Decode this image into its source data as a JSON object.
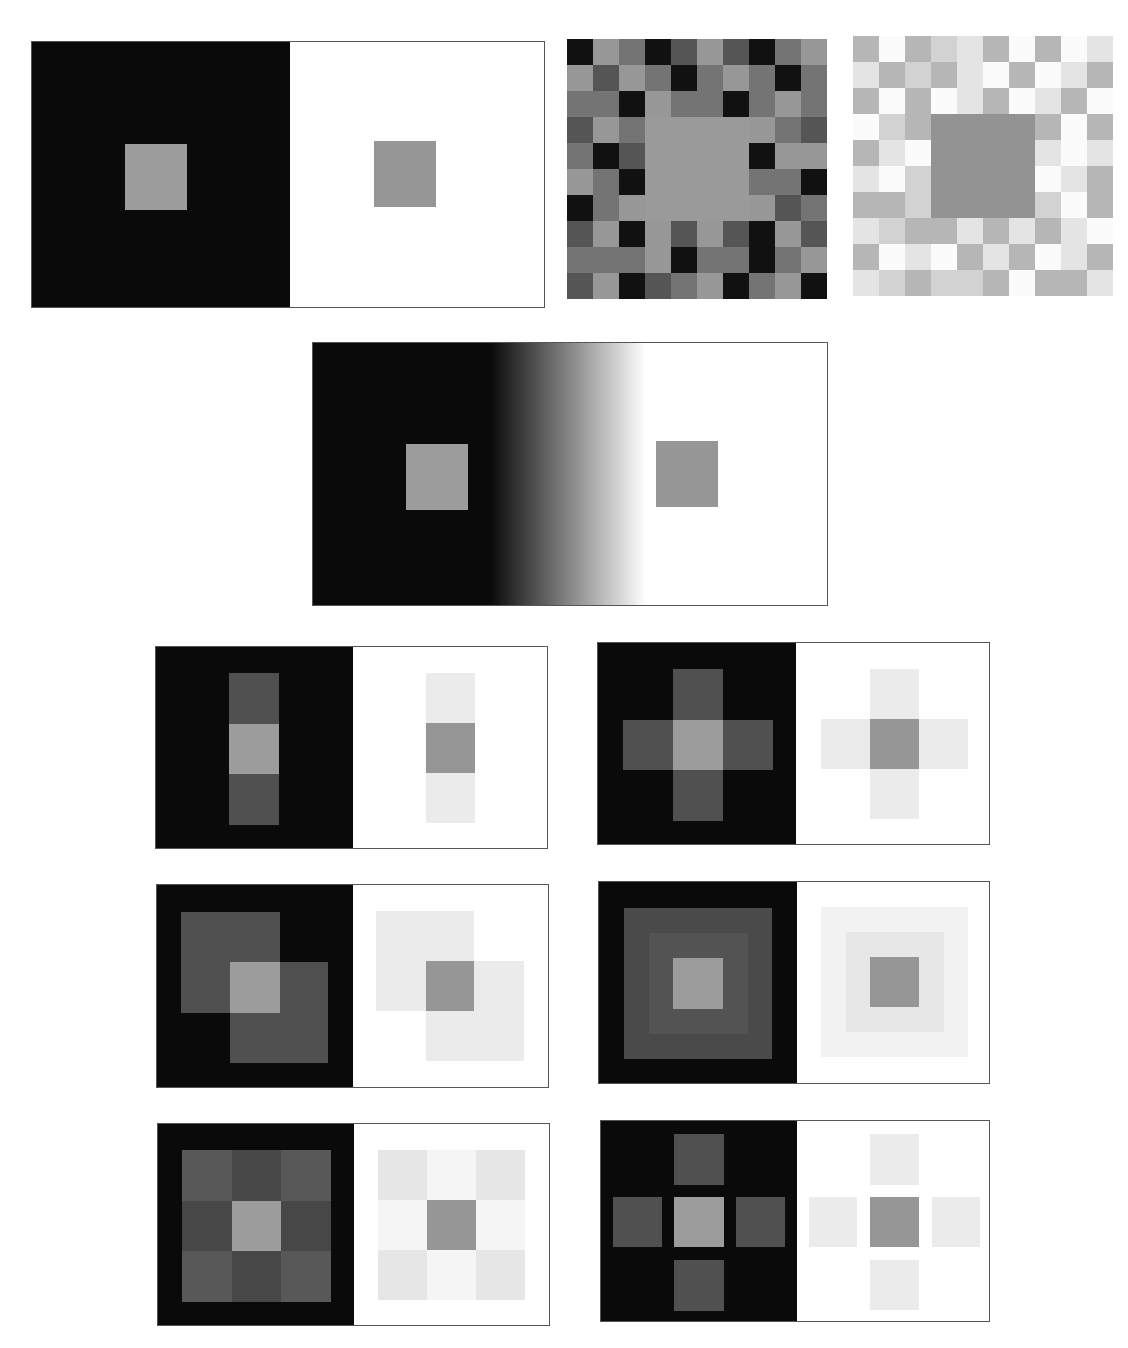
{
  "figure": {
    "target_gray": "#9a9a9a",
    "target_gray_on_white": "#969696"
  },
  "palette": {
    "black": "#0a0a0a",
    "white": "#ffffff",
    "border": "#555555",
    "dark_mosaic": {
      "K": "#111111",
      "D": "#555555",
      "M": "#747474",
      "L": "#979797",
      "C": "#9a9a9a"
    },
    "light_mosaic": {
      "W": "#fbfbfb",
      "P": "#e4e4e4",
      "S": "#d2d2d2",
      "G": "#b6b6b6",
      "C": "#939393"
    }
  },
  "panels": [
    {
      "id": "classic-contrast",
      "x": 31,
      "y": 41,
      "w": 514,
      "h": 267,
      "split": 258,
      "left_bg": "#0a0a0a",
      "right_bg": "#ffffff",
      "blocks": [
        {
          "x": 93,
          "y": 102,
          "w": 62,
          "h": 66,
          "color": "#9c9c9c",
          "label": "target-on-black"
        },
        {
          "x": 342,
          "y": 99,
          "w": 62,
          "h": 66,
          "color": "#969696",
          "label": "target-on-white"
        }
      ]
    },
    {
      "id": "gradient-contrast",
      "x": 312,
      "y": 342,
      "w": 516,
      "h": 264,
      "gradient": {
        "from": "#0a0a0a",
        "to": "#ffffff",
        "start": 178,
        "end": 333
      },
      "blocks": [
        {
          "x": 93,
          "y": 101,
          "w": 62,
          "h": 66,
          "color": "#9c9c9c",
          "label": "target-on-dark"
        },
        {
          "x": 343,
          "y": 98,
          "w": 62,
          "h": 66,
          "color": "#969696",
          "label": "target-on-light"
        }
      ]
    },
    {
      "id": "vertical-bar",
      "x": 155,
      "y": 646,
      "w": 393,
      "h": 203,
      "split": 197,
      "left_bg": "#0a0a0a",
      "right_bg": "#ffffff",
      "blocks": [
        {
          "x": 73,
          "y": 26,
          "w": 50,
          "h": 51,
          "color": "#505050",
          "label": "flank"
        },
        {
          "x": 73,
          "y": 77,
          "w": 50,
          "h": 50,
          "color": "#9c9c9c",
          "label": "target-on-black"
        },
        {
          "x": 73,
          "y": 127,
          "w": 50,
          "h": 51,
          "color": "#505050",
          "label": "flank"
        },
        {
          "x": 270,
          "y": 26,
          "w": 49,
          "h": 50,
          "color": "#ebebeb",
          "label": "flank"
        },
        {
          "x": 270,
          "y": 76,
          "w": 49,
          "h": 50,
          "color": "#969696",
          "label": "target-on-white"
        },
        {
          "x": 270,
          "y": 126,
          "w": 49,
          "h": 50,
          "color": "#ebebeb",
          "label": "flank"
        }
      ]
    },
    {
      "id": "cross",
      "x": 597,
      "y": 642,
      "w": 393,
      "h": 203,
      "split": 198,
      "left_bg": "#0a0a0a",
      "right_bg": "#ffffff",
      "blocks": [
        {
          "x": 75,
          "y": 26,
          "w": 50,
          "h": 51,
          "color": "#505050",
          "label": "arm"
        },
        {
          "x": 25,
          "y": 77,
          "w": 50,
          "h": 50,
          "color": "#505050",
          "label": "arm"
        },
        {
          "x": 125,
          "y": 77,
          "w": 50,
          "h": 50,
          "color": "#505050",
          "label": "arm"
        },
        {
          "x": 75,
          "y": 127,
          "w": 50,
          "h": 51,
          "color": "#505050",
          "label": "arm"
        },
        {
          "x": 75,
          "y": 77,
          "w": 50,
          "h": 50,
          "color": "#9c9c9c",
          "label": "target-on-black"
        },
        {
          "x": 272,
          "y": 26,
          "w": 49,
          "h": 50,
          "color": "#ebebeb",
          "label": "arm"
        },
        {
          "x": 223,
          "y": 76,
          "w": 49,
          "h": 50,
          "color": "#ebebeb",
          "label": "arm"
        },
        {
          "x": 321,
          "y": 76,
          "w": 49,
          "h": 50,
          "color": "#ebebeb",
          "label": "arm"
        },
        {
          "x": 272,
          "y": 126,
          "w": 49,
          "h": 50,
          "color": "#ebebeb",
          "label": "arm"
        },
        {
          "x": 272,
          "y": 76,
          "w": 49,
          "h": 50,
          "color": "#969696",
          "label": "target-on-white"
        }
      ]
    },
    {
      "id": "overlapping-squares",
      "x": 156,
      "y": 884,
      "w": 393,
      "h": 204,
      "split": 196,
      "left_bg": "#0a0a0a",
      "right_bg": "#ffffff",
      "blocks": [
        {
          "x": 24,
          "y": 27,
          "w": 99,
          "h": 101,
          "color": "#505050",
          "label": "square-a"
        },
        {
          "x": 73,
          "y": 77,
          "w": 98,
          "h": 101,
          "color": "#505050",
          "label": "square-b"
        },
        {
          "x": 73,
          "y": 77,
          "w": 50,
          "h": 51,
          "color": "#9c9c9c",
          "label": "target-on-black"
        },
        {
          "x": 219,
          "y": 26,
          "w": 98,
          "h": 100,
          "color": "#ebebeb",
          "label": "square-a"
        },
        {
          "x": 269,
          "y": 76,
          "w": 98,
          "h": 100,
          "color": "#ebebeb",
          "label": "square-b"
        },
        {
          "x": 269,
          "y": 76,
          "w": 48,
          "h": 50,
          "color": "#969696",
          "label": "target-on-white"
        }
      ]
    },
    {
      "id": "nested-squares",
      "x": 598,
      "y": 881,
      "w": 392,
      "h": 203,
      "split": 198,
      "left_bg": "#0a0a0a",
      "right_bg": "#ffffff",
      "blocks": [
        {
          "x": 25,
          "y": 26,
          "w": 148,
          "h": 151,
          "color": "#4a4a4a",
          "label": "outer-ring"
        },
        {
          "x": 50,
          "y": 51,
          "w": 99,
          "h": 101,
          "color": "#535353",
          "label": "middle-ring"
        },
        {
          "x": 74,
          "y": 76,
          "w": 50,
          "h": 51,
          "color": "#9c9c9c",
          "label": "target-on-black"
        },
        {
          "x": 222,
          "y": 25,
          "w": 147,
          "h": 150,
          "color": "#f2f2f2",
          "label": "outer-ring"
        },
        {
          "x": 247,
          "y": 50,
          "w": 98,
          "h": 100,
          "color": "#e7e7e7",
          "label": "middle-ring"
        },
        {
          "x": 271,
          "y": 75,
          "w": 49,
          "h": 50,
          "color": "#969696",
          "label": "target-on-white"
        }
      ]
    },
    {
      "id": "nine-grid",
      "x": 157,
      "y": 1123,
      "w": 393,
      "h": 203,
      "split": 196,
      "left_bg": "#0a0a0a",
      "right_bg": "#ffffff",
      "blocks": [
        {
          "x": 24,
          "y": 26,
          "w": 50,
          "h": 51,
          "color": "#585858",
          "label": "corner"
        },
        {
          "x": 74,
          "y": 26,
          "w": 49,
          "h": 51,
          "color": "#474747",
          "label": "edge"
        },
        {
          "x": 123,
          "y": 26,
          "w": 50,
          "h": 51,
          "color": "#585858",
          "label": "corner"
        },
        {
          "x": 24,
          "y": 77,
          "w": 50,
          "h": 50,
          "color": "#474747",
          "label": "edge"
        },
        {
          "x": 74,
          "y": 77,
          "w": 49,
          "h": 50,
          "color": "#9c9c9c",
          "label": "target-on-black"
        },
        {
          "x": 123,
          "y": 77,
          "w": 50,
          "h": 50,
          "color": "#474747",
          "label": "edge"
        },
        {
          "x": 24,
          "y": 127,
          "w": 50,
          "h": 51,
          "color": "#585858",
          "label": "corner"
        },
        {
          "x": 74,
          "y": 127,
          "w": 49,
          "h": 51,
          "color": "#474747",
          "label": "edge"
        },
        {
          "x": 123,
          "y": 127,
          "w": 50,
          "h": 51,
          "color": "#585858",
          "label": "corner"
        },
        {
          "x": 220,
          "y": 26,
          "w": 49,
          "h": 50,
          "color": "#e6e6e6",
          "label": "corner"
        },
        {
          "x": 269,
          "y": 26,
          "w": 49,
          "h": 50,
          "color": "#f5f5f5",
          "label": "edge"
        },
        {
          "x": 318,
          "y": 26,
          "w": 49,
          "h": 50,
          "color": "#e6e6e6",
          "label": "corner"
        },
        {
          "x": 220,
          "y": 76,
          "w": 49,
          "h": 50,
          "color": "#f5f5f5",
          "label": "edge"
        },
        {
          "x": 269,
          "y": 76,
          "w": 49,
          "h": 50,
          "color": "#969696",
          "label": "target-on-white"
        },
        {
          "x": 318,
          "y": 76,
          "w": 49,
          "h": 50,
          "color": "#f5f5f5",
          "label": "edge"
        },
        {
          "x": 220,
          "y": 126,
          "w": 49,
          "h": 50,
          "color": "#e6e6e6",
          "label": "corner"
        },
        {
          "x": 269,
          "y": 126,
          "w": 49,
          "h": 50,
          "color": "#f5f5f5",
          "label": "edge"
        },
        {
          "x": 318,
          "y": 126,
          "w": 49,
          "h": 50,
          "color": "#e6e6e6",
          "label": "corner"
        }
      ]
    },
    {
      "id": "separated-cross",
      "x": 600,
      "y": 1120,
      "w": 390,
      "h": 202,
      "split": 196,
      "left_bg": "#0a0a0a",
      "right_bg": "#ffffff",
      "blocks": [
        {
          "x": 73,
          "y": 13,
          "w": 50,
          "h": 51,
          "color": "#505050",
          "label": "arm-top"
        },
        {
          "x": 12,
          "y": 76,
          "w": 49,
          "h": 50,
          "color": "#505050",
          "label": "arm-left"
        },
        {
          "x": 73,
          "y": 76,
          "w": 50,
          "h": 50,
          "color": "#9c9c9c",
          "label": "target-on-black"
        },
        {
          "x": 135,
          "y": 76,
          "w": 49,
          "h": 50,
          "color": "#505050",
          "label": "arm-right"
        },
        {
          "x": 73,
          "y": 139,
          "w": 50,
          "h": 51,
          "color": "#505050",
          "label": "arm-bottom"
        },
        {
          "x": 269,
          "y": 13,
          "w": 49,
          "h": 51,
          "color": "#ebebeb",
          "label": "arm-top"
        },
        {
          "x": 208,
          "y": 76,
          "w": 48,
          "h": 50,
          "color": "#ebebeb",
          "label": "arm-left"
        },
        {
          "x": 269,
          "y": 76,
          "w": 49,
          "h": 50,
          "color": "#969696",
          "label": "target-on-white"
        },
        {
          "x": 331,
          "y": 76,
          "w": 48,
          "h": 50,
          "color": "#ebebeb",
          "label": "arm-right"
        },
        {
          "x": 269,
          "y": 139,
          "w": 49,
          "h": 50,
          "color": "#ebebeb",
          "label": "arm-bottom"
        }
      ]
    }
  ],
  "mosaics": [
    {
      "id": "dark-mosaic",
      "x": 567,
      "y": 39,
      "cell": 26,
      "cols": 10,
      "rows": 10,
      "palette": "dark_mosaic",
      "center": {
        "col": 3,
        "row": 3,
        "span": 4
      },
      "rows_data": [
        "KLMKDLDKML",
        "LDLMKMLMKM",
        "MMKLMMKMLM",
        "DLMCCCCLMD",
        "MKDCCCCKLL",
        "LMKCCCCMMK",
        "KMLCCCCLDM",
        "DLKLDLDKLD",
        "MMMLKMMKML",
        "DLKDMLKMLK"
      ]
    },
    {
      "id": "light-mosaic",
      "x": 853,
      "y": 36,
      "cell": 26,
      "cols": 10,
      "rows": 10,
      "palette": "light_mosaic",
      "center": {
        "col": 3,
        "row": 3,
        "span": 4
      },
      "rows_data": [
        "GWGSPGWGWP",
        "PGSGPWGWPG",
        "GWGWPGWPGW",
        "WSGCCCCGWG",
        "GPWCCCCPWP",
        "PWSCCCCWPG",
        "GGSCCCCSWG",
        "PSGGPGPGPW",
        "GWPWGPGWPG",
        "PSGSSGWGGP"
      ]
    }
  ]
}
